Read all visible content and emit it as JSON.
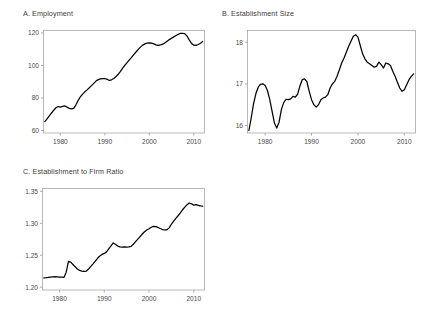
{
  "figure": {
    "background": "#ffffff",
    "line_color": "#000000",
    "frame_color": "#9a9a9a",
    "text_color": "#3c3c3c"
  },
  "panels": [
    {
      "id": "panel-a",
      "title": "A. Employment",
      "chart_data": {
        "type": "line",
        "title": "A. Employment",
        "xlabel": "",
        "ylabel": "",
        "xlim": [
          1976.2,
          2012.4
        ],
        "ylim": [
          58.5,
          121.5
        ],
        "xticks": [
          1980,
          1990,
          2000,
          2010
        ],
        "xtick_labels": [
          "1980",
          "1990",
          "2000",
          "2010"
        ],
        "yticks": [
          60,
          80,
          100,
          120
        ],
        "ytick_labels": [
          "60",
          "80",
          "100",
          "120"
        ],
        "grid": false,
        "legend": "none",
        "x": [
          1976.5,
          1977,
          1977.5,
          1978,
          1978.5,
          1979,
          1979.5,
          1980,
          1980.5,
          1981,
          1981.5,
          1982,
          1982.5,
          1983,
          1983.5,
          1984,
          1984.5,
          1985,
          1985.5,
          1986,
          1986.5,
          1987,
          1987.5,
          1988,
          1988.5,
          1989,
          1989.5,
          1990,
          1990.5,
          1991,
          1991.5,
          1992,
          1992.5,
          1993,
          1993.5,
          1994,
          1994.5,
          1995,
          1995.5,
          1996,
          1996.5,
          1997,
          1997.5,
          1998,
          1998.5,
          1999,
          1999.5,
          2000,
          2000.5,
          2001,
          2001.5,
          2002,
          2002.5,
          2003,
          2003.5,
          2004,
          2004.5,
          2005,
          2005.5,
          2006,
          2006.5,
          2007,
          2007.5,
          2008,
          2008.5,
          2009,
          2009.5,
          2010,
          2010.5,
          2011,
          2011.5,
          2012
        ],
        "y": [
          65.5,
          67.2,
          69.0,
          70.8,
          72.5,
          74.0,
          74.8,
          74.4,
          74.9,
          75.1,
          74.4,
          73.6,
          73.3,
          73.6,
          75.8,
          78.6,
          80.8,
          82.4,
          83.8,
          85.0,
          86.3,
          87.6,
          89.0,
          90.4,
          91.3,
          91.8,
          91.9,
          92.0,
          91.5,
          90.8,
          91.2,
          92.0,
          93.2,
          94.6,
          96.4,
          98.4,
          100.2,
          101.8,
          103.4,
          105.0,
          106.7,
          108.3,
          109.9,
          111.3,
          112.5,
          113.3,
          113.8,
          113.9,
          113.7,
          113.3,
          112.7,
          112.4,
          112.6,
          113.1,
          113.9,
          114.9,
          115.9,
          116.8,
          117.6,
          118.4,
          119.2,
          119.7,
          119.8,
          119.4,
          118.0,
          115.6,
          113.5,
          112.5,
          112.4,
          112.9,
          113.7,
          114.8
        ]
      }
    },
    {
      "id": "panel-b",
      "title": "B. Establishment Size",
      "chart_data": {
        "type": "line",
        "title": "B. Establishment Size",
        "xlabel": "",
        "ylabel": "",
        "xlim": [
          1976.2,
          2012.4
        ],
        "ylim": [
          15.82,
          18.28
        ],
        "xticks": [
          1980,
          1990,
          2000,
          2010
        ],
        "xtick_labels": [
          "1980",
          "1990",
          "2000",
          "2010"
        ],
        "yticks": [
          16,
          17,
          18
        ],
        "ytick_labels": [
          "16",
          "17",
          "18"
        ],
        "grid": false,
        "legend": "none",
        "x": [
          1976.5,
          1977,
          1977.5,
          1978,
          1978.5,
          1979,
          1979.5,
          1980,
          1980.5,
          1981,
          1981.5,
          1982,
          1982.5,
          1983,
          1983.5,
          1984,
          1984.5,
          1985,
          1985.5,
          1986,
          1986.5,
          1987,
          1987.5,
          1988,
          1988.5,
          1989,
          1989.5,
          1990,
          1990.5,
          1991,
          1991.5,
          1992,
          1992.5,
          1993,
          1993.5,
          1994,
          1994.5,
          1995,
          1995.5,
          1996,
          1996.5,
          1997,
          1997.5,
          1998,
          1998.5,
          1999,
          1999.5,
          2000,
          2000.5,
          2001,
          2001.5,
          2002,
          2002.5,
          2003,
          2003.5,
          2004,
          2004.5,
          2005,
          2005.5,
          2006,
          2006.5,
          2007,
          2007.5,
          2008,
          2008.5,
          2009,
          2009.5,
          2010,
          2010.5,
          2011,
          2011.5,
          2012
        ],
        "y": [
          15.88,
          16.18,
          16.52,
          16.76,
          16.92,
          16.99,
          17.0,
          16.96,
          16.84,
          16.62,
          16.34,
          16.06,
          15.94,
          16.08,
          16.38,
          16.55,
          16.63,
          16.62,
          16.64,
          16.7,
          16.68,
          16.75,
          16.95,
          17.1,
          17.12,
          17.05,
          16.82,
          16.62,
          16.5,
          16.44,
          16.5,
          16.62,
          16.66,
          16.68,
          16.74,
          16.9,
          17.0,
          17.06,
          17.18,
          17.34,
          17.5,
          17.62,
          17.76,
          17.9,
          18.02,
          18.14,
          18.18,
          18.12,
          17.92,
          17.72,
          17.6,
          17.52,
          17.48,
          17.44,
          17.4,
          17.42,
          17.52,
          17.46,
          17.38,
          17.5,
          17.48,
          17.44,
          17.3,
          17.18,
          17.04,
          16.9,
          16.82,
          16.86,
          16.98,
          17.1,
          17.18,
          17.24
        ]
      }
    },
    {
      "id": "panel-c",
      "title": "C. Establishment to Firm Ratio",
      "chart_data": {
        "type": "line",
        "title": "C. Establishment to Firm Ratio",
        "xlabel": "",
        "ylabel": "",
        "xlim": [
          1976.2,
          2012.4
        ],
        "ylim": [
          1.1955,
          1.3545
        ],
        "xticks": [
          1980,
          1990,
          2000,
          2010
        ],
        "xtick_labels": [
          "1980",
          "1990",
          "2000",
          "2010"
        ],
        "yticks": [
          1.2,
          1.25,
          1.3,
          1.35
        ],
        "ytick_labels": [
          "1.20",
          "1.25",
          "1.30",
          "1.35"
        ],
        "grid": false,
        "legend": "none",
        "x": [
          1976.5,
          1977,
          1977.5,
          1978,
          1978.5,
          1979,
          1979.5,
          1980,
          1980.5,
          1981,
          1981.5,
          1982,
          1982.5,
          1983,
          1983.5,
          1984,
          1984.5,
          1985,
          1985.5,
          1986,
          1986.5,
          1987,
          1987.5,
          1988,
          1988.5,
          1989,
          1989.5,
          1990,
          1990.5,
          1991,
          1991.5,
          1992,
          1992.5,
          1993,
          1993.5,
          1994,
          1994.5,
          1995,
          1995.5,
          1996,
          1996.5,
          1997,
          1997.5,
          1998,
          1998.5,
          1999,
          1999.5,
          2000,
          2000.5,
          2001,
          2001.5,
          2002,
          2002.5,
          2003,
          2003.5,
          2004,
          2004.5,
          2005,
          2005.5,
          2006,
          2006.5,
          2007,
          2007.5,
          2008,
          2008.5,
          2009,
          2009.5,
          2010,
          2010.5,
          2011,
          2011.5,
          2012
        ],
        "y": [
          1.2145,
          1.2148,
          1.2152,
          1.2158,
          1.2162,
          1.2165,
          1.2162,
          1.2158,
          1.2155,
          1.2152,
          1.2235,
          1.2405,
          1.2392,
          1.2355,
          1.2318,
          1.2285,
          1.2262,
          1.2252,
          1.2248,
          1.2252,
          1.2285,
          1.2325,
          1.2365,
          1.2408,
          1.2452,
          1.2488,
          1.2512,
          1.2528,
          1.2552,
          1.2598,
          1.2645,
          1.2692,
          1.2672,
          1.2642,
          1.2632,
          1.2628,
          1.2632,
          1.2628,
          1.2632,
          1.2638,
          1.2672,
          1.2712,
          1.2752,
          1.2792,
          1.2832,
          1.2868,
          1.2895,
          1.2915,
          1.2938,
          1.2952,
          1.2948,
          1.2935,
          1.2918,
          1.2902,
          1.2895,
          1.2898,
          1.2928,
          1.2985,
          1.3035,
          1.3078,
          1.3118,
          1.3165,
          1.3212,
          1.3252,
          1.3292,
          1.3318,
          1.3305,
          1.3285,
          1.3292,
          1.3282,
          1.3272,
          1.3268
        ]
      }
    }
  ]
}
